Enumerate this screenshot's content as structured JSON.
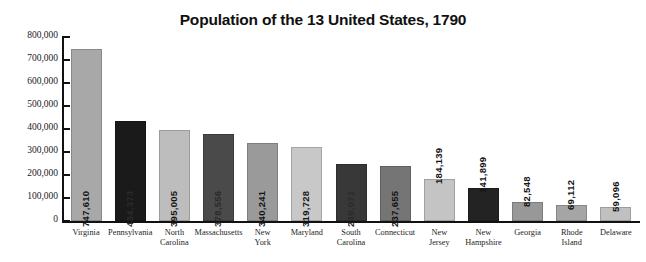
{
  "chart_data": {
    "type": "bar",
    "title": "Population of the 13 United States, 1790",
    "xlabel": "",
    "ylabel": "",
    "ylim": [
      0,
      800000
    ],
    "grid": false,
    "legend": "none",
    "orientation": "vertical",
    "value_label_format": "comma-separated integer, rotated 90 degrees",
    "ytick_labels": [
      "800,000",
      "700,000",
      "600,000",
      "500,000",
      "400,000",
      "300,000",
      "200,000",
      "100,000",
      "0"
    ],
    "ytick_values": [
      800000,
      700000,
      600000,
      500000,
      400000,
      300000,
      200000,
      100000,
      0
    ],
    "categories": [
      "Virginia",
      "Pennsylvania",
      "North Carolina",
      "Massachusetts",
      "New York",
      "Maryland",
      "South Carolina",
      "Connecticut",
      "New Jersey",
      "New Hampshire",
      "Georgia",
      "Rhode Island",
      "Delaware"
    ],
    "values": [
      747610,
      434373,
      395005,
      378556,
      340241,
      319728,
      249073,
      237655,
      184139,
      141899,
      82548,
      69112,
      59096
    ],
    "value_labels": [
      "747,610",
      "434,373",
      "395,005",
      "378,556",
      "340,241",
      "319,728",
      "249,073",
      "237,655",
      "184,139",
      "141,899",
      "82,548",
      "69,112",
      "59,096"
    ],
    "bar_colors": [
      "#a8a8a8",
      "#1a1a1a",
      "#bdbdbd",
      "#4a4a4a",
      "#9a9a9a",
      "#c8c8c8",
      "#383838",
      "#757575",
      "#c4c4c4",
      "#232323",
      "#989898",
      "#a5a5a5",
      "#c0c0c0"
    ],
    "label_placement": [
      "inside",
      "inside",
      "inside",
      "inside",
      "inside",
      "inside",
      "inside",
      "inside",
      "above",
      "above",
      "above",
      "above",
      "above"
    ]
  },
  "bars": [
    {
      "category_line1": "Virginia",
      "category_line2": "",
      "value_label": "747,610"
    },
    {
      "category_line1": "Pennsylvania",
      "category_line2": "",
      "value_label": "434,373"
    },
    {
      "category_line1": "North",
      "category_line2": "Carolina",
      "value_label": "395,005"
    },
    {
      "category_line1": "Massachusetts",
      "category_line2": "",
      "value_label": "378,556"
    },
    {
      "category_line1": "New",
      "category_line2": "York",
      "value_label": "340,241"
    },
    {
      "category_line1": "Maryland",
      "category_line2": "",
      "value_label": "319,728"
    },
    {
      "category_line1": "South",
      "category_line2": "Carolina",
      "value_label": "249,073"
    },
    {
      "category_line1": "Connecticut",
      "category_line2": "",
      "value_label": "237,655"
    },
    {
      "category_line1": "New",
      "category_line2": "Jersey",
      "value_label": "184,139"
    },
    {
      "category_line1": "New",
      "category_line2": "Hampshire",
      "value_label": "141,899"
    },
    {
      "category_line1": "Georgia",
      "category_line2": "",
      "value_label": "82,548"
    },
    {
      "category_line1": "Rhode",
      "category_line2": "Island",
      "value_label": "69,112"
    },
    {
      "category_line1": "Delaware",
      "category_line2": "",
      "value_label": "59,096"
    }
  ]
}
